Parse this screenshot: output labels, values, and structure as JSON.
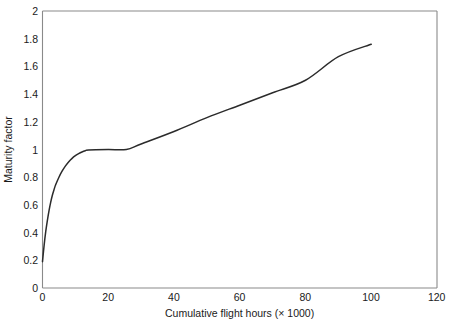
{
  "chart_data": {
    "type": "line",
    "title": "",
    "subtitle": "",
    "xlabel": "Cumulative flight hours (× 1000)",
    "ylabel": "Maturity factor",
    "xlim": [
      0,
      120
    ],
    "ylim": [
      0,
      2
    ],
    "grid": false,
    "legend": false,
    "legend_position": "none",
    "background_color": "#ffffff",
    "line_color": "#2b2b2b",
    "frame_color": "#8a8a8a",
    "xticks": [
      0,
      20,
      40,
      60,
      80,
      100,
      120
    ],
    "xtick_labels": [
      "0",
      "20",
      "40",
      "60",
      "80",
      "100",
      "120"
    ],
    "yticks": [
      0,
      0.2,
      0.4,
      0.6,
      0.8,
      1,
      1.2,
      1.4,
      1.6,
      1.8,
      2
    ],
    "ytick_labels": [
      "0",
      "0.2",
      "0.4",
      "0.6",
      "0.8",
      "1",
      "1.2",
      "1.4",
      "1.6",
      "1.8",
      "2"
    ],
    "series": [
      {
        "name": "Maturity factor",
        "x": [
          0,
          0.5,
          1,
          1.5,
          2,
          2.5,
          3,
          3.5,
          4,
          5,
          6,
          7,
          8,
          9,
          10,
          11,
          12,
          13,
          14,
          20,
          25.5,
          30,
          40,
          50,
          60,
          70,
          80,
          90,
          100
        ],
        "y": [
          0.19,
          0.31,
          0.41,
          0.49,
          0.56,
          0.62,
          0.67,
          0.71,
          0.745,
          0.8,
          0.845,
          0.882,
          0.912,
          0.936,
          0.955,
          0.97,
          0.982,
          0.991,
          0.997,
          1.0,
          1.0,
          1.04,
          1.13,
          1.23,
          1.32,
          1.41,
          1.5,
          1.67,
          1.76
        ]
      }
    ],
    "annotations": []
  },
  "figure": {
    "xlabel": "Cumulative flight hours (× 1000)",
    "ylabel": "Maturity factor"
  },
  "axis": {
    "x_ticks": [
      {
        "value": 0,
        "label": "0"
      },
      {
        "value": 20,
        "label": "20"
      },
      {
        "value": 40,
        "label": "40"
      },
      {
        "value": 60,
        "label": "60"
      },
      {
        "value": 80,
        "label": "80"
      },
      {
        "value": 100,
        "label": "100"
      },
      {
        "value": 120,
        "label": "120"
      }
    ],
    "y_ticks": [
      {
        "value": 2,
        "label": "2"
      },
      {
        "value": 1.8,
        "label": "1.8"
      },
      {
        "value": 1.6,
        "label": "1.6"
      },
      {
        "value": 1.4,
        "label": "1.4"
      },
      {
        "value": 1.2,
        "label": "1.2"
      },
      {
        "value": 1,
        "label": "1"
      },
      {
        "value": 0.8,
        "label": "0.8"
      },
      {
        "value": 0.6,
        "label": "0.6"
      },
      {
        "value": 0.4,
        "label": "0.4"
      },
      {
        "value": 0.2,
        "label": "0.2"
      },
      {
        "value": 0,
        "label": "0"
      }
    ]
  }
}
